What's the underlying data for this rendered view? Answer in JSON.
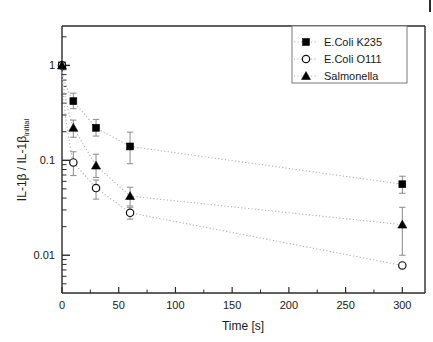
{
  "chart_data": {
    "type": "scatter",
    "title": "",
    "subtitle": "",
    "xlabel": "Time [s]",
    "ylabel": "IL-1β / IL-1β",
    "ylabel_subscript": "initial",
    "xscale": "linear",
    "yscale": "log",
    "xlim": [
      0,
      320
    ],
    "ylim": [
      0.004,
      2.6
    ],
    "xticks": [
      0,
      50,
      100,
      150,
      200,
      250,
      300
    ],
    "xticklabels": [
      "0",
      "50",
      "100",
      "150",
      "200",
      "250",
      "300"
    ],
    "yticks": [
      1,
      0.1,
      0.01
    ],
    "yticklabels": [
      "1",
      "0.1",
      "0.01"
    ],
    "grid": false,
    "legend_position": "top-right",
    "x": [
      0,
      10,
      30,
      60,
      300
    ],
    "series": [
      {
        "name": "E.Coli K235",
        "marker": "filled-square",
        "color": "#000000",
        "values": [
          1.0,
          0.42,
          0.22,
          0.14,
          0.056
        ],
        "err_low": [
          0.0,
          0.07,
          0.04,
          0.048,
          0.011
        ],
        "err_high": [
          0.0,
          0.09,
          0.05,
          0.058,
          0.012
        ],
        "fit": "dotted"
      },
      {
        "name": "E.Coli O111",
        "marker": "open-circle",
        "color": "#000000",
        "values": [
          1.0,
          0.095,
          0.051,
          0.028,
          0.0078
        ],
        "err_low": [
          0.0,
          0.026,
          0.012,
          0.004,
          0.0
        ],
        "err_high": [
          0.0,
          0.028,
          0.011,
          0.004,
          0.0
        ],
        "fit": "dotted"
      },
      {
        "name": "Salmonella",
        "marker": "filled-triangle",
        "color": "#000000",
        "values": [
          1.0,
          0.22,
          0.088,
          0.042,
          0.021
        ],
        "err_low": [
          0.0,
          0.045,
          0.022,
          0.009,
          0.011
        ],
        "err_high": [
          0.0,
          0.045,
          0.028,
          0.01,
          0.011
        ],
        "fit": "dotted"
      }
    ]
  },
  "legend": {
    "entries": [
      {
        "label": "E.Coli K235"
      },
      {
        "label": "E.Coli O111"
      },
      {
        "label": "Salmonella"
      }
    ]
  },
  "axes": {
    "x_title": "Time [s]",
    "y_title_main": "IL-1β / IL-1β",
    "y_title_sub": "initial",
    "x_tick_labels": [
      "0",
      "50",
      "100",
      "150",
      "200",
      "250",
      "300"
    ],
    "y_tick_labels": [
      "1",
      "0.1",
      "0.01"
    ]
  },
  "colors": {
    "axis": "#2b2b2b",
    "marker": "#000000",
    "fit_line": "#b0b0b0",
    "error_bar": "#8a8a8a",
    "legend_border": "#7a7a7a",
    "background": "#ffffff"
  }
}
